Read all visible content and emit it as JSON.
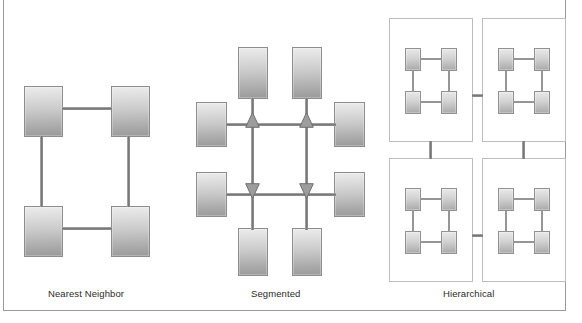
{
  "figure": {
    "background_color": "#ffffff",
    "frame_border_color": "#9b9b9b",
    "node_fill_top": "#ececec",
    "node_fill_bottom": "#9a9a9a",
    "node_border_color": "#8d8d8d",
    "link_color": "#7e7e7e",
    "arrow_fill": "#9a9a9a",
    "cluster_border_color": "#bdbdbd",
    "caption_color": "#2b2b2b"
  },
  "panels": [
    {
      "id": "nearest-neighbor",
      "caption": "Nearest Neighbor",
      "topology": "ring",
      "node_count": 4,
      "nodes": [
        {
          "id": "nn-tl",
          "x": 24,
          "y": 86,
          "w": 39,
          "h": 51
        },
        {
          "id": "nn-tr",
          "x": 111,
          "y": 86,
          "w": 39,
          "h": 51
        },
        {
          "id": "nn-bl",
          "x": 24,
          "y": 206,
          "w": 39,
          "h": 51
        },
        {
          "id": "nn-br",
          "x": 111,
          "y": 206,
          "w": 39,
          "h": 51
        }
      ],
      "links": [
        {
          "from": "nn-tl",
          "to": "nn-tr",
          "orientation": "horizontal"
        },
        {
          "from": "nn-bl",
          "to": "nn-br",
          "orientation": "horizontal"
        },
        {
          "from": "nn-tl",
          "to": "nn-bl",
          "orientation": "vertical"
        },
        {
          "from": "nn-tr",
          "to": "nn-br",
          "orientation": "vertical"
        }
      ]
    },
    {
      "id": "segmented",
      "caption": "Segmented",
      "topology": "grid-with-routers",
      "node_count": 8,
      "arrow_count": 4,
      "nodes": [
        {
          "id": "sg-top-1",
          "x": 238,
          "y": 47,
          "w": 30,
          "h": 52
        },
        {
          "id": "sg-top-2",
          "x": 292,
          "y": 47,
          "w": 30,
          "h": 52
        },
        {
          "id": "sg-left-1",
          "x": 196,
          "y": 102,
          "w": 31,
          "h": 45
        },
        {
          "id": "sg-right-1",
          "x": 334,
          "y": 102,
          "w": 31,
          "h": 45
        },
        {
          "id": "sg-left-2",
          "x": 196,
          "y": 172,
          "w": 31,
          "h": 45
        },
        {
          "id": "sg-right-2",
          "x": 334,
          "y": 172,
          "w": 31,
          "h": 45
        },
        {
          "id": "sg-bottom-1",
          "x": 238,
          "y": 228,
          "w": 30,
          "h": 48
        },
        {
          "id": "sg-bottom-2",
          "x": 292,
          "y": 228,
          "w": 30,
          "h": 48
        }
      ],
      "arrows": [
        {
          "id": "sg-arrow-1",
          "direction": "up",
          "x": 245,
          "y": 117
        },
        {
          "id": "sg-arrow-2",
          "direction": "up",
          "x": 299,
          "y": 117
        },
        {
          "id": "sg-arrow-3",
          "direction": "down",
          "x": 245,
          "y": 186
        },
        {
          "id": "sg-arrow-4",
          "direction": "down",
          "x": 299,
          "y": 186
        }
      ]
    },
    {
      "id": "hierarchical",
      "caption": "Hierarchical",
      "topology": "clusters-of-rings",
      "cluster_count": 4,
      "nodes_per_cluster": 4,
      "clusters": [
        {
          "id": "hc-tl",
          "x": 389,
          "y": 18,
          "w": 84,
          "h": 124
        },
        {
          "id": "hc-tr",
          "x": 482,
          "y": 18,
          "w": 84,
          "h": 124
        },
        {
          "id": "hc-bl",
          "x": 389,
          "y": 158,
          "w": 84,
          "h": 124
        },
        {
          "id": "hc-br",
          "x": 482,
          "y": 158,
          "w": 84,
          "h": 124
        }
      ],
      "cluster_links": [
        {
          "from": "hc-tl",
          "to": "hc-tr",
          "orientation": "horizontal"
        },
        {
          "from": "hc-bl",
          "to": "hc-br",
          "orientation": "horizontal"
        },
        {
          "from": "hc-tl",
          "to": "hc-bl",
          "orientation": "vertical"
        },
        {
          "from": "hc-tr",
          "to": "hc-br",
          "orientation": "vertical"
        }
      ]
    }
  ],
  "captions": {
    "nearest_neighbor": "Nearest Neighbor",
    "segmented": "Segmented",
    "hierarchical": "Hierarchical"
  }
}
